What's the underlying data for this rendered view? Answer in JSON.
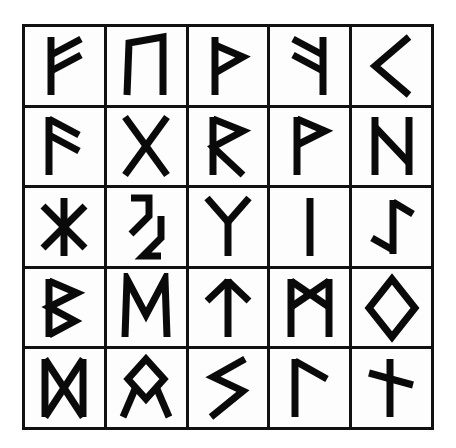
{
  "page": {
    "background_color": "#ffffff",
    "ink_color": "#0a0a0a",
    "grid_rows": 5,
    "grid_columns": 5,
    "total_glyphs": 25
  },
  "grid": {
    "border_color": "#111111",
    "cell_background": "#fdfdfd",
    "rows": [
      [
        {
          "name": "fehu",
          "label": "ᚠ",
          "transliteration": "f"
        },
        {
          "name": "uruz",
          "label": "ᚢ",
          "transliteration": "u"
        },
        {
          "name": "thurisaz",
          "label": "ᚦ",
          "transliteration": "th"
        },
        {
          "name": "ansuz-mirrored",
          "label": "ᚨ",
          "transliteration": "a"
        },
        {
          "name": "kenaz",
          "label": "ᚲ",
          "transliteration": "k"
        }
      ],
      [
        {
          "name": "ansuz",
          "label": "ᚨ",
          "transliteration": "a"
        },
        {
          "name": "gebo",
          "label": "ᚷ",
          "transliteration": "g"
        },
        {
          "name": "raidho",
          "label": "ᚱ",
          "transliteration": "r"
        },
        {
          "name": "wunjo",
          "label": "ᚹ",
          "transliteration": "w"
        },
        {
          "name": "hagalaz",
          "label": "ᚺ",
          "transliteration": "h"
        }
      ],
      [
        {
          "name": "hagalaz-star",
          "label": "ᚼ",
          "transliteration": "h"
        },
        {
          "name": "jera",
          "label": "ᛃ",
          "transliteration": "j"
        },
        {
          "name": "algiz",
          "label": "ᛉ",
          "transliteration": "z"
        },
        {
          "name": "isa",
          "label": "ᛁ",
          "transliteration": "i"
        },
        {
          "name": "eihwaz",
          "label": "ᛇ",
          "transliteration": "ei"
        }
      ],
      [
        {
          "name": "berkano",
          "label": "ᛒ",
          "transliteration": "b"
        },
        {
          "name": "ehwaz",
          "label": "ᛖ",
          "transliteration": "e"
        },
        {
          "name": "tiwaz",
          "label": "ᛏ",
          "transliteration": "t"
        },
        {
          "name": "mannaz",
          "label": "ᛗ",
          "transliteration": "m"
        },
        {
          "name": "ingwaz",
          "label": "ᛜ",
          "transliteration": "ng"
        }
      ],
      [
        {
          "name": "dagaz",
          "label": "ᛞ",
          "transliteration": "d"
        },
        {
          "name": "othala",
          "label": "ᛟ",
          "transliteration": "o"
        },
        {
          "name": "sowilo",
          "label": "ᛋ",
          "transliteration": "s"
        },
        {
          "name": "laguz",
          "label": "ᛚ",
          "transliteration": "l"
        },
        {
          "name": "naudhiz-cross",
          "label": "ᛝ",
          "transliteration": "n"
        }
      ]
    ]
  }
}
